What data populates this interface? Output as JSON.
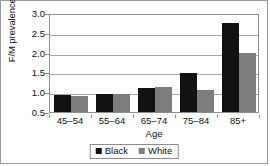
{
  "chart_data": {
    "type": "bar",
    "title": "",
    "xlabel": "Age",
    "ylabel": "F/M prevalence ratio",
    "categories": [
      "45–54",
      "55–64",
      "65–74",
      "75–84",
      "85+"
    ],
    "series": [
      {
        "name": "Black",
        "color": "#121212",
        "values": [
          0.92,
          0.96,
          1.11,
          1.49,
          2.76
        ]
      },
      {
        "name": "White",
        "color": "#7d7d7d",
        "values": [
          0.91,
          0.96,
          1.13,
          1.06,
          2.0
        ]
      }
    ],
    "ylim": [
      0.5,
      3.0
    ],
    "yticks": [
      "3.0",
      "2.5",
      "2.0",
      "1.5",
      "1.0",
      "0.5"
    ],
    "ytick_values": [
      3.0,
      2.5,
      2.0,
      1.5,
      1.0,
      0.5
    ],
    "grid": true,
    "legend_position": "bottom"
  },
  "legend": {
    "entries": [
      {
        "label": "Black"
      },
      {
        "label": "White"
      }
    ]
  }
}
